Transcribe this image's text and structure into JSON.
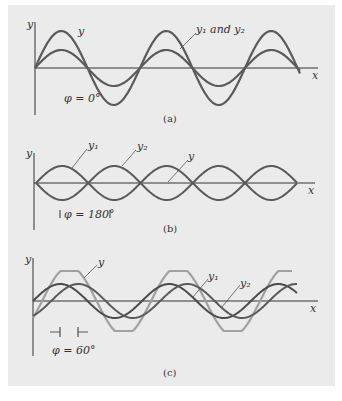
{
  "figure": {
    "background": "#ebebeb",
    "curve_color": "#5a5a5a",
    "light_curve_color": "#9a9a9a",
    "panels": [
      {
        "id": "a",
        "caption": "(a)",
        "y_label": "y",
        "x_label": "x",
        "labels": {
          "resultant": "y",
          "components": "y₁ and y₂"
        },
        "phase_label": "φ = 0°"
      },
      {
        "id": "b",
        "caption": "(b)",
        "y_label": "y",
        "x_label": "x",
        "labels": {
          "y1": "y₁",
          "y2": "y₂",
          "resultant": "y"
        },
        "phase_label": "φ = 180°"
      },
      {
        "id": "c",
        "caption": "(c)",
        "y_label": "y",
        "x_label": "x",
        "labels": {
          "resultant": "y",
          "y1": "y₁",
          "y2": "y₂"
        },
        "phase_label": "φ = 60°"
      }
    ]
  }
}
